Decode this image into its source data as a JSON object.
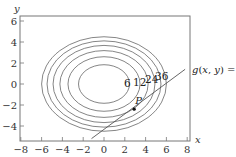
{
  "chart_data": {
    "type": "contour",
    "title": "",
    "xlabel": "x",
    "ylabel": "y",
    "xlim": [
      -8,
      8.5
    ],
    "ylim": [
      -5.5,
      6.5
    ],
    "grid": false,
    "x_ticks": [
      -8,
      -6,
      -4,
      -2,
      0,
      2,
      4,
      6,
      8
    ],
    "y_ticks": [
      6,
      4,
      2,
      0,
      -2,
      -4
    ],
    "x_tick_labels": [
      "−8",
      "−6",
      "−4",
      "−2",
      "0",
      "2",
      "4",
      "6",
      "8"
    ],
    "y_tick_labels": [
      "6",
      "4",
      "2",
      "0",
      "−2",
      "−4"
    ],
    "contour_center": [
      0,
      0
    ],
    "contour_levels": [
      6,
      12,
      18,
      24,
      30,
      36
    ],
    "contour_labels": [
      {
        "text": "6",
        "level": 6
      },
      {
        "text": "12",
        "level": 12
      },
      {
        "text": "24",
        "level": 24
      },
      {
        "text": "36",
        "level": 36
      }
    ],
    "constraint_curve": {
      "label": "g(x, y) = 0",
      "type": "line",
      "from": [
        -1.2,
        -5.2
      ],
      "to": [
        7.8,
        1.4
      ]
    },
    "point": {
      "label": "P",
      "x": 2.9,
      "y": -2.4
    }
  }
}
